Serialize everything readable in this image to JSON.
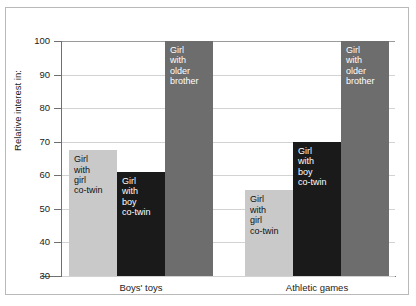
{
  "chart_data": {
    "type": "bar",
    "title": "",
    "xlabel": "",
    "ylabel": "Relative interest in:",
    "ylim": [
      30,
      100
    ],
    "yticks": [
      30,
      40,
      50,
      60,
      70,
      80,
      90,
      100
    ],
    "grid": true,
    "legend": "in-bar labels",
    "categories": [
      "Boys' toys",
      "Athletic games"
    ],
    "series": [
      {
        "name": "Girl with girl co-twin",
        "color": "#c9c9c9",
        "values": [
          67.5,
          55.5
        ]
      },
      {
        "name": "Girl with boy co-twin",
        "color": "#1a1a1a",
        "values": [
          61.0,
          70.0
        ]
      },
      {
        "name": "Girl with older brother",
        "color": "#6d6d6d",
        "values": [
          100.0,
          100.0
        ]
      }
    ],
    "bars": [
      {
        "group": "Boys' toys",
        "series": "Girl with girl co-twin",
        "value": 67.5,
        "label": "Girl\nwith\ngirl\nco-twin",
        "color": "#c9c9c9",
        "style": "light"
      },
      {
        "group": "Boys' toys",
        "series": "Girl with boy co-twin",
        "value": 61.0,
        "label": "Girl\nwith\nboy\nco-twin",
        "color": "#1a1a1a",
        "style": "dark"
      },
      {
        "group": "Boys' toys",
        "series": "Girl with older brother",
        "value": 100.0,
        "label": "Girl\nwith\nolder\nbrother",
        "color": "#6d6d6d",
        "style": "medium"
      },
      {
        "group": "Athletic games",
        "series": "Girl with girl co-twin",
        "value": 55.5,
        "label": "Girl\nwith\ngirl\nco-twin",
        "color": "#c9c9c9",
        "style": "light"
      },
      {
        "group": "Athletic games",
        "series": "Girl with boy co-twin",
        "value": 70.0,
        "label": "Girl\nwith\nboy\nco-twin",
        "color": "#1a1a1a",
        "style": "dark"
      },
      {
        "group": "Athletic games",
        "series": "Girl with older brother",
        "value": 100.0,
        "label": "Girl\nwith\nolder\nbrother",
        "color": "#6d6d6d",
        "style": "medium"
      }
    ]
  },
  "axis": {
    "y_title": "Relative interest in:",
    "ticks": [
      {
        "value": 100,
        "label": "100"
      },
      {
        "value": 90,
        "label": "90"
      },
      {
        "value": 80,
        "label": "80"
      },
      {
        "value": 70,
        "label": "70"
      },
      {
        "value": 60,
        "label": "60"
      },
      {
        "value": 50,
        "label": "50"
      },
      {
        "value": 40,
        "label": "40"
      },
      {
        "value": 30,
        "label": "30"
      }
    ]
  },
  "groups": [
    {
      "label": "Boys' toys"
    },
    {
      "label": "Athletic games"
    }
  ],
  "colors": {
    "light_gray": "#c9c9c9",
    "black": "#1a1a1a",
    "medium_gray": "#6d6d6d",
    "gridline": "#d2d2d2",
    "axis": "#707070",
    "frame": "#b9b9b9",
    "text": "#1b1b1b"
  }
}
